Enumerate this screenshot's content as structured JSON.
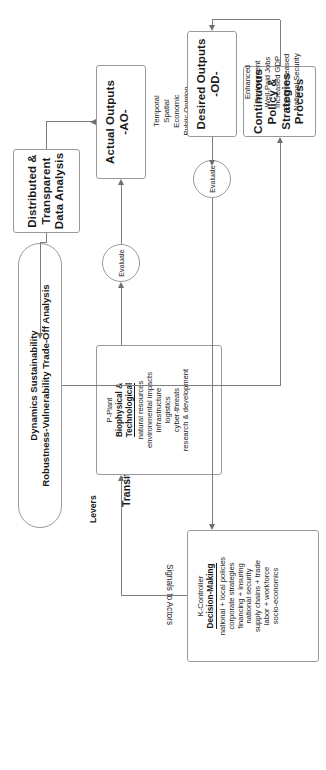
{
  "diagram": {
    "title_free_text": "Transition to a Net-Zero-Carbon\nEconomy",
    "analysis_capsule": "Dynamics Sustainability\nRobustness-Vulnerability Trade-Off Analysis",
    "edge_labels": {
      "levers": "Levers",
      "signals_to_actors": "Signals to Actors"
    },
    "evaluate_nodes": [
      {
        "id": "evaluate-upper",
        "label": "Evaluate"
      },
      {
        "id": "evaluate-lower",
        "label": "Evaluate"
      }
    ],
    "boxes": {
      "data_analysis": {
        "name": "distributed-transparent-data-analysis",
        "lines": [
          "Distributed &",
          "Transparent",
          "Data Analysis"
        ]
      },
      "policy_process": {
        "name": "continuous-policy-strategies-process",
        "lines": [
          "Continuous",
          "Policy &",
          "Strategies",
          "Process"
        ]
      },
      "actual_outputs": {
        "name": "actual-outputs",
        "title": "Actual Outputs",
        "code": "-AO-",
        "items": [
          "Temporal",
          "Spatial",
          "Economic",
          "Public Opinion",
          "Risks",
          "Unintended",
          "Consequences",
          "Opportunities"
        ]
      },
      "desired_outputs": {
        "name": "desired-outputs",
        "title": "Desired Outputs",
        "code": "-OD-",
        "items": [
          "Enhanced",
          "Environment",
          "Well-Paid Jobs",
          "Increased GDP",
          "Equity Increased",
          "National Security"
        ]
      },
      "plant": {
        "name": "p-plant-biophysical-technological",
        "tag": "P-Plant",
        "title_line1": "Biophysical &",
        "title_line2": "Technological",
        "items": [
          "natural resources",
          "environmental impacts",
          "infrastructure",
          "logistics",
          "cyber-threats",
          "research & development"
        ]
      },
      "controller": {
        "name": "k-controller-decision-making",
        "tag": "K-Controller",
        "title": "Decision-Making",
        "items": [
          "national + local policies",
          "corporate strategies",
          "financing + insuring",
          "national security",
          "supply chains + trade",
          "labor + workforce",
          "socio-economics"
        ]
      }
    },
    "colors": {
      "stroke": "#9a9a9a",
      "arrow": "#6e6e6e",
      "text": "#1a1a1a",
      "background": "#ffffff"
    }
  }
}
